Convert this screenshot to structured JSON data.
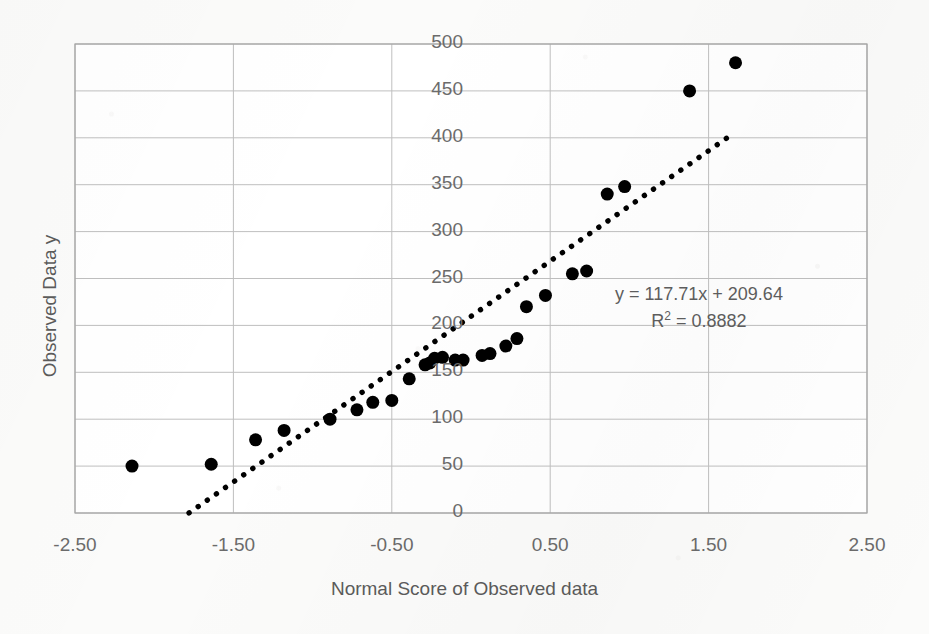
{
  "chart_data": {
    "type": "scatter",
    "title": "",
    "xlabel": "Normal Score of Observed data",
    "ylabel": "Observed Data y",
    "xlim": [
      -2.5,
      2.5
    ],
    "ylim": [
      0,
      500
    ],
    "xticks": [
      -2.5,
      -1.5,
      -0.5,
      0.5,
      1.5,
      2.5
    ],
    "xtick_labels": [
      "-2.50",
      "-1.50",
      "-0.50",
      "0.50",
      "1.50",
      "2.50"
    ],
    "yticks": [
      0,
      50,
      100,
      150,
      200,
      250,
      300,
      350,
      400,
      450,
      500
    ],
    "ytick_labels": [
      "0",
      "50",
      "100",
      "150",
      "200",
      "250",
      "300",
      "350",
      "400",
      "450",
      "500"
    ],
    "grid": true,
    "legend": false,
    "marker": "filled-circle",
    "marker_color": "#000000",
    "marker_size": 13,
    "series": [
      {
        "name": "Observed Data y",
        "points": [
          {
            "x": -2.14,
            "y": 50
          },
          {
            "x": -1.64,
            "y": 52
          },
          {
            "x": -1.36,
            "y": 78
          },
          {
            "x": -1.18,
            "y": 88
          },
          {
            "x": -0.89,
            "y": 100
          },
          {
            "x": -0.72,
            "y": 110
          },
          {
            "x": -0.62,
            "y": 118
          },
          {
            "x": -0.5,
            "y": 120
          },
          {
            "x": -0.39,
            "y": 143
          },
          {
            "x": -0.29,
            "y": 158
          },
          {
            "x": -0.26,
            "y": 160
          },
          {
            "x": -0.23,
            "y": 165
          },
          {
            "x": -0.18,
            "y": 166
          },
          {
            "x": -0.1,
            "y": 163
          },
          {
            "x": -0.05,
            "y": 163
          },
          {
            "x": 0.07,
            "y": 168
          },
          {
            "x": 0.12,
            "y": 170
          },
          {
            "x": 0.22,
            "y": 178
          },
          {
            "x": 0.29,
            "y": 186
          },
          {
            "x": 0.35,
            "y": 220
          },
          {
            "x": 0.47,
            "y": 232
          },
          {
            "x": 0.64,
            "y": 255
          },
          {
            "x": 0.73,
            "y": 258
          },
          {
            "x": 0.86,
            "y": 340
          },
          {
            "x": 0.97,
            "y": 348
          },
          {
            "x": 1.38,
            "y": 450
          },
          {
            "x": 1.67,
            "y": 480
          }
        ]
      }
    ],
    "trendline": {
      "style": "dotted",
      "color": "#000000",
      "slope": 117.71,
      "intercept": 209.64,
      "x_start": -1.78,
      "x_end": 1.62,
      "equation_text": "y = 117.71x + 209.64",
      "r2_label": "R",
      "r2_exponent": "2",
      "r2_text": " = 0.8882",
      "r2_value": 0.8882
    },
    "annotations": [
      {
        "name": "trendline-equation",
        "text": "y = 117.71x + 209.64"
      },
      {
        "name": "r-squared",
        "text": "R² = 0.8882"
      }
    ],
    "style": {
      "background": "#fbfbfa",
      "plot_background": "#ffffff",
      "grid_color": "#bfbfbf",
      "border_color": "#a6a6a6",
      "text_color": "#5b5b5b"
    }
  }
}
